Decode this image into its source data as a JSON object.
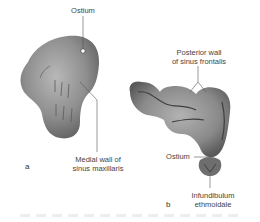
{
  "figure": {
    "panel_a": {
      "letter": "a",
      "labels": {
        "ostium": "Ostium",
        "medial_wall_line1": "Medial wall of",
        "medial_wall_line2": "sinus maxillaris"
      }
    },
    "panel_b": {
      "letter": "b",
      "labels": {
        "posterior_wall_line1": "Posterior wall",
        "posterior_wall_line2": "of sinus frontalis",
        "ostium": "Ostium",
        "infundibulum_line1": "Infundibulum",
        "infundibulum_line2": "ethmoidale"
      }
    },
    "colors": {
      "cast_fill": "#8c8c8c",
      "cast_dark": "#5a5a5a",
      "cast_light": "#b5b5b5",
      "leader_line": "#555555",
      "text": "#444444"
    }
  }
}
